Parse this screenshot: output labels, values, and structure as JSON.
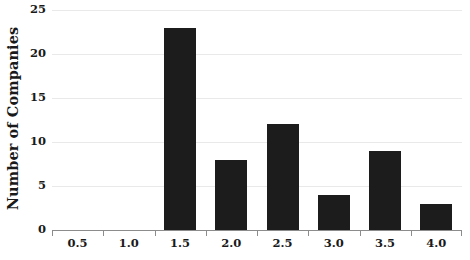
{
  "chart_data": {
    "type": "bar",
    "title": "",
    "subtitle": "",
    "xlabel": "",
    "ylabel": "Number of Companies",
    "categories": [
      "0.5",
      "1.0",
      "1.5",
      "2.0",
      "2.5",
      "3.0",
      "3.5",
      "4.0"
    ],
    "values": [
      0,
      0,
      23,
      8,
      12,
      4,
      9,
      3
    ],
    "xlim": [
      0.25,
      4.25
    ],
    "ylim": [
      0,
      25
    ],
    "ytick_labels": [
      "0",
      "5",
      "10",
      "15",
      "20",
      "25"
    ],
    "ytick_values": [
      0,
      5,
      10,
      15,
      20,
      25
    ],
    "xtick_labels": [
      "0.5",
      "1.0",
      "1.5",
      "2.0",
      "2.5",
      "3.0",
      "3.5",
      "4.0"
    ],
    "grid": true,
    "grid_axis": "y",
    "legend": false,
    "legend_position": "none",
    "bar_color": "#1c1c1c",
    "grid_color": "#e9e9e9",
    "axis_color": "#8c8c8c",
    "background_color": "#ffffff",
    "text_color": "#1a1a1a"
  },
  "axes": {
    "y_title": "Number of Companies"
  }
}
